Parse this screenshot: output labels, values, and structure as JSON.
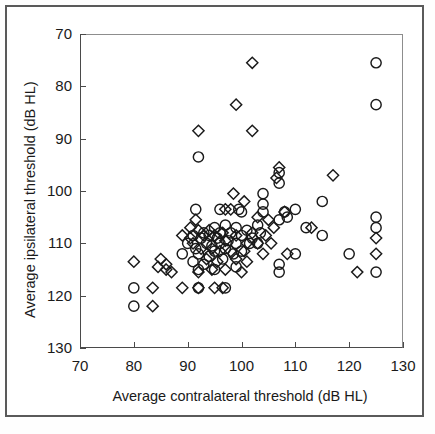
{
  "figure": {
    "type": "scatter-plot",
    "background": "#ffffff",
    "frame_color": "#5a5a5a",
    "axis_color": "#4a4a4a",
    "marker_color": "#1a1a1a"
  },
  "chart_data": {
    "type": "scatter",
    "title": "",
    "xlabel": "Average contralateral threshold (dB HL)",
    "ylabel": "Average ipsilateral threshold (dB HL)",
    "xlim": [
      70,
      130
    ],
    "ylim": [
      70,
      130
    ],
    "xticks": [
      70,
      80,
      90,
      100,
      110,
      120,
      130
    ],
    "yticks": [
      70,
      80,
      90,
      100,
      110,
      120,
      130
    ],
    "grid": false,
    "legend": "none",
    "series": [
      {
        "name": "circle-markers",
        "marker": "circle",
        "points": [
          [
            125,
            124.5
          ],
          [
            125,
            116.5
          ],
          [
            92,
            106.5
          ],
          [
            107,
            103.5
          ],
          [
            107,
            101.5
          ],
          [
            104,
            99.5
          ],
          [
            115,
            98
          ],
          [
            104,
            97.5
          ],
          [
            96,
            96.5
          ],
          [
            110,
            96.5
          ],
          [
            108,
            96
          ],
          [
            91.5,
            96.5
          ],
          [
            104,
            96
          ],
          [
            99.5,
            96.5
          ],
          [
            100,
            96
          ],
          [
            108.5,
            95
          ],
          [
            125,
            95
          ],
          [
            107,
            94.5
          ],
          [
            125,
            93
          ],
          [
            103,
            93.5
          ],
          [
            97,
            93.5
          ],
          [
            95,
            93
          ],
          [
            112,
            93
          ],
          [
            99,
            93
          ],
          [
            101,
            92.5
          ],
          [
            93,
            92
          ],
          [
            103.5,
            92
          ],
          [
            96,
            92
          ],
          [
            98,
            92
          ],
          [
            94,
            91.5
          ],
          [
            91,
            91.5
          ],
          [
            115,
            91.5
          ],
          [
            100,
            91.5
          ],
          [
            102,
            91
          ],
          [
            95.5,
            91
          ],
          [
            92.5,
            91
          ],
          [
            97.5,
            90.5
          ],
          [
            93.5,
            90
          ],
          [
            90,
            90
          ],
          [
            96,
            90
          ],
          [
            99,
            90
          ],
          [
            101.5,
            90
          ],
          [
            103,
            90
          ],
          [
            94.5,
            89.5
          ],
          [
            91.5,
            89
          ],
          [
            97,
            89
          ],
          [
            100,
            88.5
          ],
          [
            95,
            88.5
          ],
          [
            92,
            88
          ],
          [
            98.5,
            88
          ],
          [
            89,
            88
          ],
          [
            110,
            88
          ],
          [
            120,
            88
          ],
          [
            94,
            87.5
          ],
          [
            96.5,
            87
          ],
          [
            91,
            86.5
          ],
          [
            93,
            86
          ],
          [
            107,
            86
          ],
          [
            99,
            85.5
          ],
          [
            95,
            85
          ],
          [
            92,
            85
          ],
          [
            107,
            84.5
          ],
          [
            125,
            84.5
          ],
          [
            97,
            81.5
          ],
          [
            92,
            81.5
          ],
          [
            80,
            81.5
          ],
          [
            80,
            78
          ]
        ]
      },
      {
        "name": "diamond-markers",
        "marker": "diamond",
        "points": [
          [
            102,
            124.5
          ],
          [
            99,
            116.5
          ],
          [
            92,
            111.5
          ],
          [
            102,
            111.5
          ],
          [
            117,
            103
          ],
          [
            107,
            104.5
          ],
          [
            106.5,
            102.5
          ],
          [
            98.5,
            99.5
          ],
          [
            100.5,
            98
          ],
          [
            97,
            96.5
          ],
          [
            98,
            96.5
          ],
          [
            103,
            95
          ],
          [
            108,
            96
          ],
          [
            91.5,
            94.5
          ],
          [
            105,
            94.5
          ],
          [
            90.5,
            93
          ],
          [
            92,
            92.5
          ],
          [
            94,
            92.5
          ],
          [
            96.5,
            92
          ],
          [
            106,
            93
          ],
          [
            113,
            93
          ],
          [
            89,
            91.5
          ],
          [
            90.5,
            91
          ],
          [
            93,
            91.5
          ],
          [
            95,
            91.5
          ],
          [
            99,
            91.5
          ],
          [
            102,
            92
          ],
          [
            104.5,
            91.5
          ],
          [
            125,
            91
          ],
          [
            91,
            90
          ],
          [
            97,
            90.5
          ],
          [
            101,
            90
          ],
          [
            103,
            90
          ],
          [
            105.5,
            90
          ],
          [
            92.5,
            89
          ],
          [
            94.5,
            89
          ],
          [
            96,
            88.5
          ],
          [
            98,
            88.5
          ],
          [
            100.5,
            88.5
          ],
          [
            104,
            88
          ],
          [
            108.5,
            88
          ],
          [
            125,
            88
          ],
          [
            85,
            87
          ],
          [
            80,
            86.5
          ],
          [
            86,
            86
          ],
          [
            93.5,
            87
          ],
          [
            95.5,
            86.5
          ],
          [
            99,
            87
          ],
          [
            101,
            86.5
          ],
          [
            84.5,
            85.5
          ],
          [
            86,
            85
          ],
          [
            87,
            84.5
          ],
          [
            92,
            84.5
          ],
          [
            94.5,
            85
          ],
          [
            97,
            85
          ],
          [
            100,
            84.5
          ],
          [
            121.5,
            84.5
          ],
          [
            89,
            81.5
          ],
          [
            92,
            81.5
          ],
          [
            95,
            81.5
          ],
          [
            96.5,
            81.5
          ],
          [
            83.5,
            81.5
          ],
          [
            83.5,
            78
          ]
        ]
      }
    ]
  },
  "axes": {
    "y_tick_labels": [
      "130",
      "120",
      "110",
      "100",
      "90",
      "80",
      "70"
    ],
    "x_tick_labels": [
      "70",
      "80",
      "90",
      "100",
      "110",
      "120",
      "130"
    ]
  }
}
